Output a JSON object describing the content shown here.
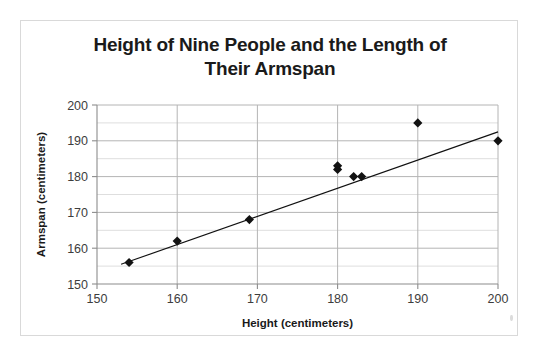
{
  "figure": {
    "title": "Height of Nine People and the Length of Their Armspan",
    "title_line1": "Height of Nine People and the Length of",
    "title_line2": "Their Armspan"
  },
  "chart_data": {
    "type": "scatter",
    "title": "Height of Nine People and the Length of Their Armspan",
    "xlabel": "Height (centimeters)",
    "ylabel": "Armspan (centimeters)",
    "xlim": [
      150,
      200
    ],
    "ylim": [
      150,
      200
    ],
    "xticks": [
      150,
      160,
      170,
      180,
      190,
      200
    ],
    "yticks": [
      150,
      160,
      170,
      180,
      190,
      200
    ],
    "xtick_labels": [
      "150",
      "160",
      "170",
      "180",
      "190",
      "200"
    ],
    "ytick_labels": [
      "150",
      "160",
      "170",
      "180",
      "190",
      "200"
    ],
    "x_minor_step": 5,
    "y_minor_step": 5,
    "grid": true,
    "grid_major_color": "#b4b4b4",
    "grid_minor_color": "#dedede",
    "legend": false,
    "marker": "diamond",
    "marker_color": "#121212",
    "points": [
      {
        "x": 154,
        "y": 156
      },
      {
        "x": 160,
        "y": 162
      },
      {
        "x": 169,
        "y": 168
      },
      {
        "x": 180,
        "y": 183
      },
      {
        "x": 180,
        "y": 182
      },
      {
        "x": 182,
        "y": 180
      },
      {
        "x": 183,
        "y": 180
      },
      {
        "x": 190,
        "y": 195
      },
      {
        "x": 200,
        "y": 190
      }
    ],
    "trendline": {
      "type": "linear",
      "x_start": 153,
      "y_start": 155.5,
      "x_end": 200,
      "y_end": 192.5
    }
  }
}
